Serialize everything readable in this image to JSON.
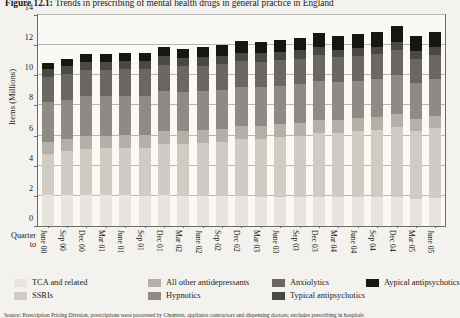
{
  "figure": {
    "label": "Figure 12.1:",
    "title": " Trends in prescribing of mental health drugs in general practice in England",
    "source_note": "Source: Prescription Pricing Division, prescriptions were processed by Chemists, appliance contractors and dispensing doctors; excludes prescribing in hospitals"
  },
  "chart_data": {
    "type": "bar",
    "stacked": true,
    "title": "Trends in prescribing of mental health drugs in general practice in England",
    "xlabel": "Quarter to",
    "ylabel": "Items (Millions)",
    "ylim": [
      0,
      14
    ],
    "yticks": [
      0,
      2,
      4,
      6,
      8,
      10,
      12,
      14
    ],
    "grid": true,
    "legend_position": "bottom",
    "categories": [
      "June 00",
      "Sep 00",
      "Dec 00",
      "Mar 01",
      "June 01",
      "Sep 01",
      "Dec 01",
      "Mar 02",
      "June 02",
      "Sep 02",
      "Dec 02",
      "Mar 03",
      "June 03",
      "Sep 03",
      "Dec 03",
      "Mar 04",
      "June 04",
      "Sep 04",
      "Dec 04",
      "Mar 05",
      "June 05"
    ],
    "series": [
      {
        "name": "TCA and related",
        "color": "#e8e5de",
        "values": [
          2.05,
          2.05,
          2.05,
          2.05,
          2.05,
          2.0,
          2.05,
          2.0,
          2.0,
          2.0,
          2.0,
          1.95,
          1.95,
          1.95,
          1.95,
          1.9,
          1.9,
          1.9,
          1.9,
          1.8,
          1.85
        ]
      },
      {
        "name": "SSRIs",
        "color": "#cfccc4",
        "values": [
          2.75,
          2.9,
          3.05,
          3.1,
          3.15,
          3.2,
          3.4,
          3.45,
          3.5,
          3.6,
          3.8,
          3.85,
          3.95,
          4.05,
          4.25,
          4.3,
          4.4,
          4.5,
          4.7,
          4.5,
          4.65
        ]
      },
      {
        "name": "All other antidepressants",
        "color": "#b3b0a8",
        "values": [
          0.8,
          0.8,
          0.85,
          0.85,
          0.85,
          0.85,
          0.85,
          0.85,
          0.85,
          0.85,
          0.85,
          0.85,
          0.85,
          0.85,
          0.85,
          0.85,
          0.85,
          0.85,
          0.85,
          0.8,
          0.8
        ]
      },
      {
        "name": "Hypnotics",
        "color": "#8e8b84",
        "values": [
          2.6,
          2.6,
          2.65,
          2.6,
          2.6,
          2.6,
          2.65,
          2.6,
          2.6,
          2.6,
          2.6,
          2.55,
          2.55,
          2.55,
          2.6,
          2.5,
          2.5,
          2.5,
          2.55,
          2.4,
          2.45
        ]
      },
      {
        "name": "Anxiolytics",
        "color": "#6b6862",
        "values": [
          1.7,
          1.75,
          1.75,
          1.75,
          1.75,
          1.75,
          1.75,
          1.7,
          1.7,
          1.7,
          1.7,
          1.7,
          1.7,
          1.7,
          1.7,
          1.65,
          1.65,
          1.65,
          1.7,
          1.6,
          1.6
        ]
      },
      {
        "name": "Typical antipsychotics",
        "color": "#4a4842",
        "values": [
          0.55,
          0.55,
          0.55,
          0.55,
          0.55,
          0.55,
          0.55,
          0.55,
          0.55,
          0.55,
          0.55,
          0.55,
          0.55,
          0.55,
          0.55,
          0.5,
          0.5,
          0.5,
          0.5,
          0.5,
          0.5
        ]
      },
      {
        "name": "Aypical antipsychotics",
        "color": "#17160f",
        "values": [
          0.4,
          0.45,
          0.5,
          0.5,
          0.55,
          0.55,
          0.6,
          0.6,
          0.65,
          0.7,
          0.75,
          0.75,
          0.8,
          0.85,
          0.9,
          0.9,
          0.95,
          1.0,
          1.05,
          1.0,
          1.05
        ]
      }
    ],
    "totals": [
      10.85,
      11.1,
      11.4,
      11.4,
      11.5,
      11.5,
      11.85,
      11.75,
      11.85,
      12.0,
      12.25,
      12.2,
      12.35,
      12.5,
      12.8,
      12.6,
      12.75,
      12.9,
      13.25,
      12.6,
      12.9
    ]
  },
  "legend": {
    "items": [
      {
        "label": "TCA and related",
        "color": "#e8e5de",
        "row": 0,
        "col": 0
      },
      {
        "label": "All other antidepressants",
        "color": "#b3b0a8",
        "row": 0,
        "col": 1
      },
      {
        "label": "Anxiolytics",
        "color": "#6b6862",
        "row": 0,
        "col": 2
      },
      {
        "label": "Aypical antipsychotics",
        "color": "#17160f",
        "row": 0,
        "col": 3
      },
      {
        "label": "SSRIs",
        "color": "#cfccc4",
        "row": 1,
        "col": 0
      },
      {
        "label": "Hypnotics",
        "color": "#8e8b84",
        "row": 1,
        "col": 1
      },
      {
        "label": "Typical antipsychotics",
        "color": "#4a4842",
        "row": 1,
        "col": 2
      }
    ]
  }
}
